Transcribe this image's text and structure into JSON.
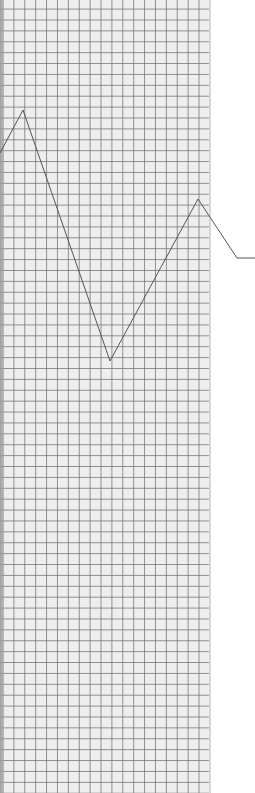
{
  "scene": {
    "description": "graph paper with hand-drawn zigzag line",
    "paper_color": "#eeeeee",
    "grid_color": "#6e6e6e",
    "line_color": "#555555",
    "background_color": "#ffffff"
  },
  "drawing": {
    "line_points": [
      [
        0,
        153
      ],
      [
        23,
        110
      ],
      [
        110,
        361
      ],
      [
        198,
        199
      ],
      [
        237,
        258
      ],
      [
        255,
        258
      ]
    ]
  }
}
